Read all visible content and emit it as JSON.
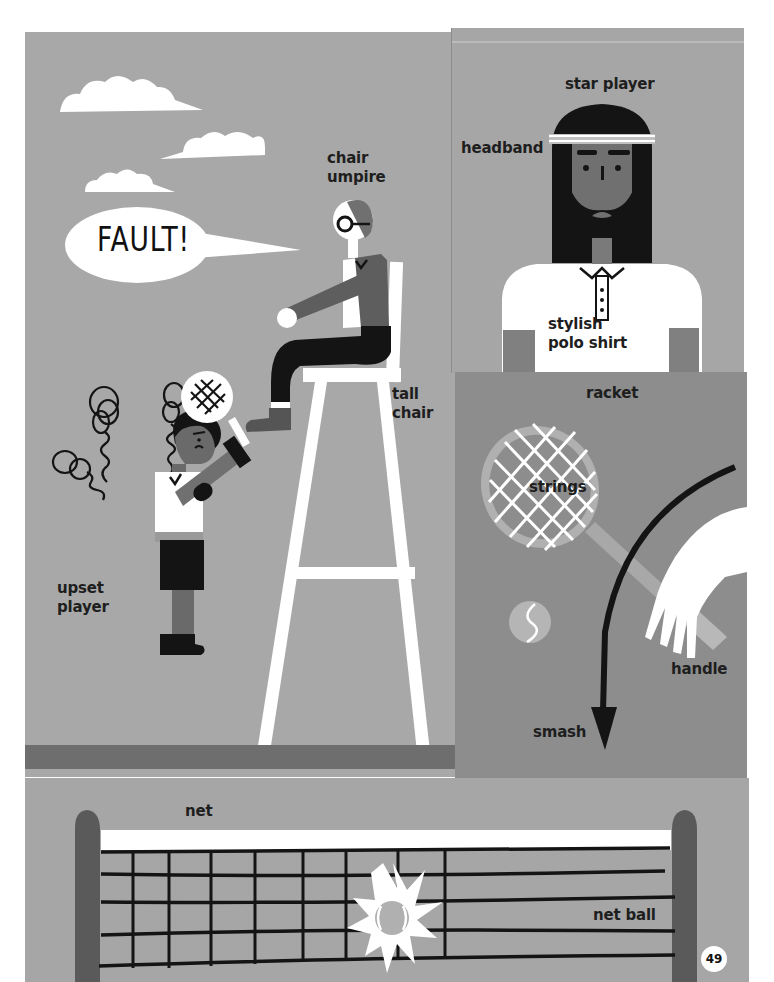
{
  "page": {
    "number": "49",
    "colors": {
      "sky_gray": "#a8a8a8",
      "panel_mid": "#9b9b9b",
      "panel_dark": "#8a8a8a",
      "court_band": "#6e6e6e",
      "net_bg": "#a6a6a6",
      "post": "#5a5a5a",
      "ink": "#141414",
      "white": "#ffffff"
    }
  },
  "panels": {
    "umpire_scene": {
      "speech_bubble": "FAULT!",
      "labels": {
        "chair_umpire_line1": "chair",
        "chair_umpire_line2": "umpire",
        "tall_chair_line1": "tall",
        "tall_chair_line2": "chair",
        "upset_player_line1": "upset",
        "upset_player_line2": "player"
      }
    },
    "star_player": {
      "labels": {
        "title": "star player",
        "headband": "headband",
        "polo_line1": "stylish",
        "polo_line2": "polo shirt"
      }
    },
    "racket_scene": {
      "labels": {
        "racket": "racket",
        "strings": "strings",
        "handle": "handle",
        "smash": "smash"
      }
    },
    "net_scene": {
      "labels": {
        "net": "net",
        "net_ball": "net ball"
      }
    }
  }
}
